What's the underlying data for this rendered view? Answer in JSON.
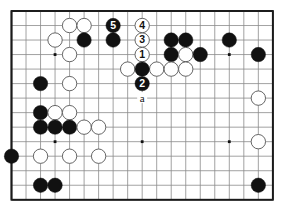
{
  "figure": {
    "kind": "go-board-diagram",
    "caption": "",
    "board": {
      "cols": 19,
      "rows": 14,
      "view": "partial-board-top-left-crop",
      "origin_x": 11.5,
      "origin_y": 11.0,
      "spacing": 14.52,
      "visible_cols": 19,
      "visible_rows": 14,
      "border_color": "#1a1a1a",
      "line_color": "#8a8a8a",
      "edge_color": "#222222",
      "background": "#ffffff",
      "star_color": "#111111",
      "star_points": [
        {
          "c": 3,
          "r": 3
        },
        {
          "c": 9,
          "r": 3
        },
        {
          "c": 15,
          "r": 3
        },
        {
          "c": 3,
          "r": 9
        },
        {
          "c": 9,
          "r": 9
        },
        {
          "c": 15,
          "r": 9
        }
      ]
    },
    "colors": {
      "black_stone": "#111111",
      "white_stone": "#ffffff",
      "white_stone_edge": "#555555",
      "black_label": "#ffffff",
      "white_label": "#111111",
      "point_label": "#111111"
    },
    "stones": [
      {
        "c": 4,
        "r": 1,
        "color": "white"
      },
      {
        "c": 5,
        "r": 1,
        "color": "white"
      },
      {
        "c": 3,
        "r": 2,
        "color": "white"
      },
      {
        "c": 5,
        "r": 2,
        "color": "black"
      },
      {
        "c": 7,
        "r": 2,
        "color": "black"
      },
      {
        "c": 9,
        "r": 2,
        "color": "white"
      },
      {
        "c": 11,
        "r": 2,
        "color": "black"
      },
      {
        "c": 12,
        "r": 2,
        "color": "black"
      },
      {
        "c": 15,
        "r": 2,
        "color": "black"
      },
      {
        "c": 9,
        "r": 3,
        "color": "white"
      },
      {
        "c": 11,
        "r": 3,
        "color": "black"
      },
      {
        "c": 12,
        "r": 3,
        "color": "white"
      },
      {
        "c": 13,
        "r": 3,
        "color": "black"
      },
      {
        "c": 17,
        "r": 3,
        "color": "black"
      },
      {
        "c": 4,
        "r": 3,
        "color": "white"
      },
      {
        "c": 8,
        "r": 4,
        "color": "white"
      },
      {
        "c": 10,
        "r": 4,
        "color": "white"
      },
      {
        "c": 11,
        "r": 4,
        "color": "white"
      },
      {
        "c": 12,
        "r": 4,
        "color": "white"
      },
      {
        "c": 9,
        "r": 4,
        "color": "black"
      },
      {
        "c": 2,
        "r": 5,
        "color": "black"
      },
      {
        "c": 4,
        "r": 5,
        "color": "white"
      },
      {
        "c": 9,
        "r": 5,
        "color": "black"
      },
      {
        "c": 2,
        "r": 7,
        "color": "black"
      },
      {
        "c": 3,
        "r": 7,
        "color": "white"
      },
      {
        "c": 4,
        "r": 7,
        "color": "white"
      },
      {
        "c": 17,
        "r": 6,
        "color": "white"
      },
      {
        "c": 2,
        "r": 8,
        "color": "black"
      },
      {
        "c": 3,
        "r": 8,
        "color": "black"
      },
      {
        "c": 4,
        "r": 8,
        "color": "black"
      },
      {
        "c": 5,
        "r": 8,
        "color": "white"
      },
      {
        "c": 6,
        "r": 8,
        "color": "white"
      },
      {
        "c": 0,
        "r": 10,
        "color": "black"
      },
      {
        "c": 2,
        "r": 10,
        "color": "white"
      },
      {
        "c": 4,
        "r": 10,
        "color": "white"
      },
      {
        "c": 6,
        "r": 10,
        "color": "white"
      },
      {
        "c": 17,
        "r": 9,
        "color": "white"
      },
      {
        "c": 2,
        "r": 12,
        "color": "black"
      },
      {
        "c": 3,
        "r": 12,
        "color": "black"
      },
      {
        "c": 17,
        "r": 12,
        "color": "black"
      }
    ],
    "numbered_moves": [
      {
        "c": 9,
        "r": 3,
        "label": "1",
        "color": "black"
      },
      {
        "c": 9,
        "r": 5,
        "label": "2",
        "color": "white"
      },
      {
        "c": 9,
        "r": 2,
        "label": "3",
        "color": "black"
      },
      {
        "c": 9,
        "r": 1,
        "label": "4",
        "color": "white"
      },
      {
        "c": 7,
        "r": 1,
        "label": "5",
        "color": "black"
      }
    ],
    "point_labels": [
      {
        "c": 9,
        "r": 6,
        "label": "a"
      }
    ]
  }
}
